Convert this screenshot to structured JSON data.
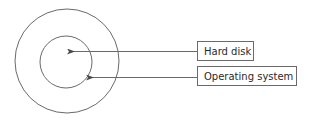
{
  "diagram": {
    "labels": [
      {
        "id": "hard-disk",
        "text": "Hard disk",
        "points_to": "inner-circle-center"
      },
      {
        "id": "operating-system",
        "text": "Operating system",
        "points_to": "inner-circle-edge"
      }
    ],
    "colors": {
      "stroke": "#6a6a6a",
      "text": "#2a2a2a",
      "background": "#ffffff"
    }
  }
}
